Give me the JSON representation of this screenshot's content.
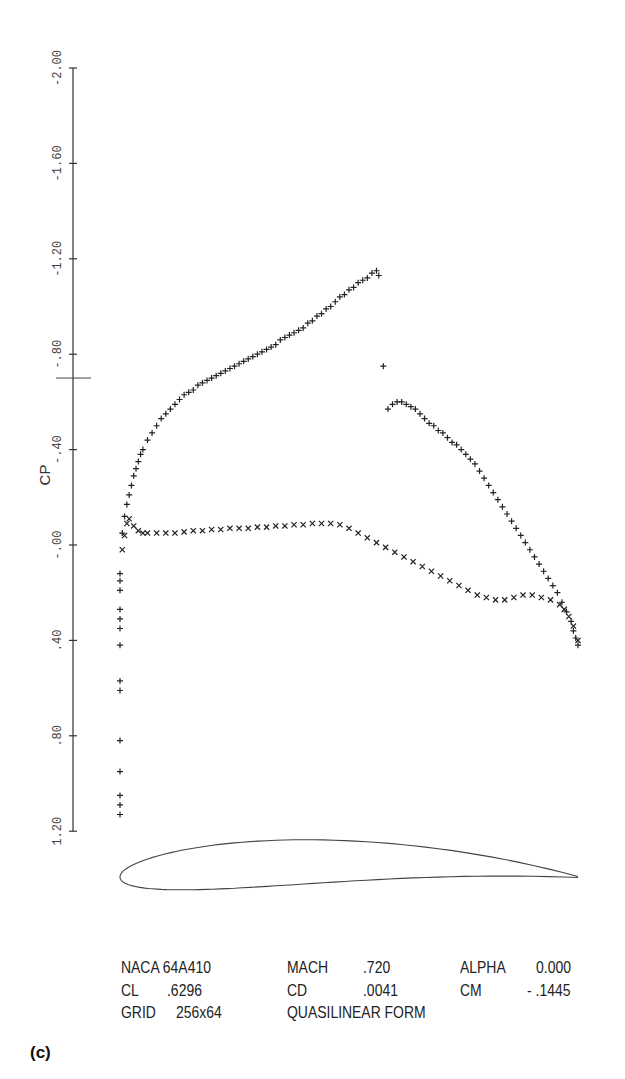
{
  "chart_data": {
    "type": "scatter",
    "title": "",
    "xlabel": "",
    "ylabel": "CP",
    "y_axis_inverted": true,
    "ylim": [
      -2.0,
      1.2
    ],
    "yticks": [
      -2.0,
      -1.6,
      -1.2,
      -0.8,
      -0.4,
      0.0,
      0.4,
      0.8,
      1.2
    ],
    "ytick_labels": [
      "-2.00",
      "-1.60",
      "-1.20",
      "-.80",
      "-.40",
      "-.00",
      ".40",
      ".80",
      "1.20"
    ],
    "critical_cp_marker": -0.7,
    "xlim": [
      0,
      1
    ],
    "grid": false,
    "legend": null,
    "series": [
      {
        "name": "upper surface",
        "marker": "+",
        "x": [
          0.005,
          0.01,
          0.015,
          0.02,
          0.025,
          0.03,
          0.035,
          0.04,
          0.045,
          0.05,
          0.06,
          0.07,
          0.08,
          0.09,
          0.1,
          0.11,
          0.12,
          0.13,
          0.14,
          0.15,
          0.16,
          0.17,
          0.18,
          0.19,
          0.2,
          0.21,
          0.22,
          0.23,
          0.24,
          0.25,
          0.26,
          0.27,
          0.28,
          0.29,
          0.3,
          0.31,
          0.32,
          0.33,
          0.34,
          0.35,
          0.36,
          0.37,
          0.38,
          0.39,
          0.4,
          0.41,
          0.42,
          0.43,
          0.44,
          0.45,
          0.46,
          0.47,
          0.48,
          0.49,
          0.5,
          0.51,
          0.52,
          0.53,
          0.54,
          0.55,
          0.56,
          0.565,
          0.575,
          0.585,
          0.595,
          0.605,
          0.615,
          0.625,
          0.635,
          0.645,
          0.655,
          0.665,
          0.675,
          0.685,
          0.695,
          0.705,
          0.715,
          0.725,
          0.735,
          0.745,
          0.755,
          0.765,
          0.775,
          0.785,
          0.795,
          0.805,
          0.815,
          0.825,
          0.835,
          0.845,
          0.855,
          0.865,
          0.875,
          0.885,
          0.895,
          0.905,
          0.915,
          0.925,
          0.935,
          0.945,
          0.955,
          0.965,
          0.975,
          0.985,
          0.99,
          0.995,
          1.0
        ],
        "values": [
          -0.05,
          -0.12,
          -0.17,
          -0.21,
          -0.25,
          -0.29,
          -0.32,
          -0.35,
          -0.38,
          -0.4,
          -0.44,
          -0.47,
          -0.5,
          -0.53,
          -0.55,
          -0.57,
          -0.59,
          -0.61,
          -0.63,
          -0.64,
          -0.65,
          -0.67,
          -0.68,
          -0.69,
          -0.7,
          -0.71,
          -0.72,
          -0.73,
          -0.74,
          -0.75,
          -0.76,
          -0.77,
          -0.78,
          -0.79,
          -0.8,
          -0.81,
          -0.82,
          -0.83,
          -0.84,
          -0.86,
          -0.87,
          -0.88,
          -0.89,
          -0.9,
          -0.91,
          -0.93,
          -0.94,
          -0.96,
          -0.97,
          -0.99,
          -1.0,
          -1.02,
          -1.04,
          -1.05,
          -1.07,
          -1.08,
          -1.1,
          -1.11,
          -1.12,
          -1.14,
          -1.15,
          -1.13,
          -0.75,
          -0.57,
          -0.59,
          -0.6,
          -0.6,
          -0.59,
          -0.58,
          -0.57,
          -0.55,
          -0.53,
          -0.51,
          -0.5,
          -0.48,
          -0.47,
          -0.45,
          -0.43,
          -0.42,
          -0.4,
          -0.38,
          -0.36,
          -0.34,
          -0.31,
          -0.28,
          -0.25,
          -0.22,
          -0.19,
          -0.16,
          -0.13,
          -0.1,
          -0.07,
          -0.04,
          -0.01,
          0.02,
          0.05,
          0.08,
          0.11,
          0.14,
          0.17,
          0.2,
          0.24,
          0.28,
          0.32,
          0.36,
          0.39,
          0.42
        ]
      },
      {
        "name": "lower surface",
        "marker": "x",
        "x": [
          0.005,
          0.01,
          0.015,
          0.02,
          0.03,
          0.04,
          0.05,
          0.06,
          0.08,
          0.1,
          0.12,
          0.14,
          0.16,
          0.18,
          0.2,
          0.22,
          0.24,
          0.26,
          0.28,
          0.3,
          0.32,
          0.34,
          0.36,
          0.38,
          0.4,
          0.42,
          0.44,
          0.46,
          0.48,
          0.5,
          0.52,
          0.54,
          0.56,
          0.58,
          0.6,
          0.62,
          0.64,
          0.66,
          0.68,
          0.7,
          0.72,
          0.74,
          0.76,
          0.78,
          0.8,
          0.82,
          0.84,
          0.86,
          0.88,
          0.9,
          0.92,
          0.94,
          0.96,
          0.97,
          0.98,
          0.99,
          1.0
        ],
        "values": [
          0.02,
          -0.04,
          -0.09,
          -0.11,
          -0.08,
          -0.06,
          -0.05,
          -0.05,
          -0.05,
          -0.05,
          -0.05,
          -0.055,
          -0.06,
          -0.06,
          -0.065,
          -0.065,
          -0.07,
          -0.07,
          -0.07,
          -0.075,
          -0.075,
          -0.08,
          -0.08,
          -0.085,
          -0.085,
          -0.09,
          -0.09,
          -0.09,
          -0.085,
          -0.07,
          -0.05,
          -0.03,
          -0.01,
          0.01,
          0.03,
          0.05,
          0.07,
          0.09,
          0.11,
          0.13,
          0.15,
          0.17,
          0.19,
          0.21,
          0.22,
          0.23,
          0.23,
          0.22,
          0.21,
          0.21,
          0.22,
          0.23,
          0.25,
          0.27,
          0.3,
          0.34,
          0.4
        ]
      },
      {
        "name": "stagnation / leading-edge points",
        "marker": "+",
        "x": [
          0.0,
          0.0,
          0.0,
          0.0,
          0.0,
          0.0,
          0.0,
          0.0,
          0.0,
          0.0,
          0.0,
          0.0,
          0.0,
          0.0
        ],
        "values": [
          0.12,
          0.15,
          0.19,
          0.27,
          0.31,
          0.35,
          0.42,
          0.57,
          0.61,
          0.82,
          0.95,
          1.05,
          1.09,
          1.13
        ]
      }
    ],
    "airfoil_outline": {
      "name": "NACA 64A410",
      "chord_x_range": [
        0,
        1
      ]
    },
    "annotations": [
      "NACA 64A410",
      "MACH .720",
      "ALPHA 0.000",
      "CL .6296",
      "CD .0041",
      "CM - .1445",
      "GRID 256x64",
      "QUASILINEAR FORM"
    ]
  },
  "info": {
    "row1": {
      "airfoil": "NACA 64A410",
      "mach_label": "MACH",
      "mach_value": ".720",
      "alpha_label": "ALPHA",
      "alpha_value": "0.000"
    },
    "row2": {
      "cl_label": "CL",
      "cl_value": ".6296",
      "cd_label": "CD",
      "cd_value": ".0041",
      "cm_label": "CM",
      "cm_value": "- .1445"
    },
    "row3": {
      "grid_label": "GRID",
      "grid_value": "256x64",
      "form": "QUASILINEAR FORM"
    }
  },
  "panel_label": "(c)"
}
